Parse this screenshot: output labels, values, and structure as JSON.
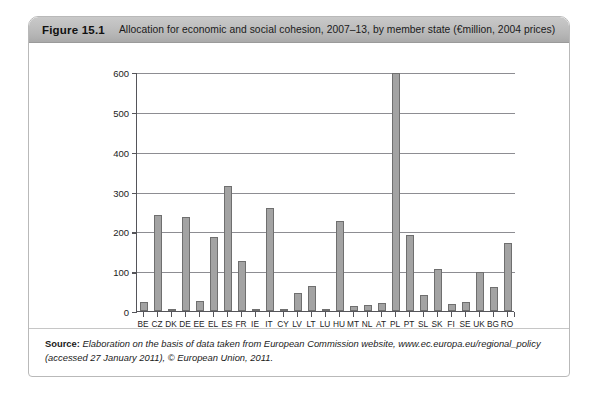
{
  "figure": {
    "number": "Figure 15.1",
    "title": "Allocation for economic and social cohesion, 2007–13, by member state (€million, 2004 prices)"
  },
  "source": {
    "label": "Source:",
    "text": " Elaboration on the basis of data taken from European Commission website, www.ec.europa.eu/regional_policy (accessed 27 January 2011), © European Union, 2011."
  },
  "colors": {
    "bar_fill": "#a3a3a3",
    "bar_stroke": "#6f6f6f",
    "axis": "#55555a",
    "gridline": "#8d8d92",
    "header_band": "#bfbfbf",
    "card_border": "#b9b9b9"
  },
  "chart_data": {
    "type": "bar",
    "title": "Allocation for economic and social cohesion, 2007–13, by member state (€million, 2004 prices)",
    "xlabel": "",
    "ylabel": "",
    "ylim": [
      0,
      600
    ],
    "yticks": [
      0,
      100,
      200,
      300,
      400,
      500,
      600
    ],
    "grid": true,
    "legend": "none",
    "categories": [
      "BE",
      "CZ",
      "DK",
      "DE",
      "EE",
      "EL",
      "ES",
      "FR",
      "IE",
      "IT",
      "CY",
      "LV",
      "LT",
      "LU",
      "HU",
      "MT",
      "NL",
      "AT",
      "PL",
      "PT",
      "SL",
      "SK",
      "FI",
      "SE",
      "UK",
      "BG",
      "RO"
    ],
    "values": [
      22,
      240,
      4,
      236,
      26,
      185,
      313,
      125,
      6,
      258,
      5,
      45,
      62,
      2,
      226,
      12,
      15,
      20,
      598,
      190,
      40,
      105,
      18,
      22,
      98,
      60,
      170
    ]
  }
}
